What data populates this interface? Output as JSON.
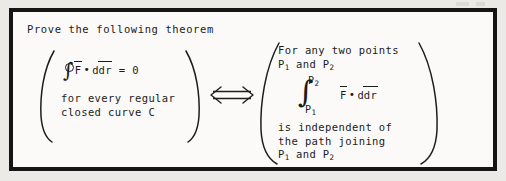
{
  "page": {
    "title": "Prove the following theorem"
  },
  "theorem": {
    "relation_symbol": "⟺",
    "relation_name": "if-and-only-if",
    "left_side": {
      "equation": {
        "integral_symbol": "∮",
        "integrand_field": "F",
        "integrand_differential": "dr",
        "dot_operator": "•",
        "equals": "=",
        "value": "0"
      },
      "condition_lines": [
        "for every regular",
        "closed curve C"
      ]
    },
    "right_side": {
      "intro_lines": [
        "For any two points",
        "P₁ and P₂"
      ],
      "intro_line_1": "For any two points",
      "intro_line_2_prefix": "P",
      "intro_line_2_sub1": "1",
      "intro_line_2_mid": " and P",
      "intro_line_2_sub2": "2",
      "integral": {
        "symbol": "∫",
        "upper_limit_base": "P",
        "upper_limit_sub": "2",
        "lower_limit_base": "P",
        "lower_limit_sub": "1",
        "integrand_field": "F",
        "integrand_differential": "dr",
        "dot_operator": "•"
      },
      "conclusion_lines": [
        "is independent of",
        "the path joining",
        "P₁ and P₂"
      ],
      "conclusion_line_1": "is independent of",
      "conclusion_line_2": "the path joining",
      "conclusion_line_3_prefix": "P",
      "conclusion_line_3_sub1": "1",
      "conclusion_line_3_mid": " and P",
      "conclusion_line_3_sub2": "2"
    }
  },
  "colors": {
    "ink": "#1b1b1b",
    "frame": "#151515",
    "paper": "#fbfaf8",
    "scan_background": "#eceae6"
  }
}
